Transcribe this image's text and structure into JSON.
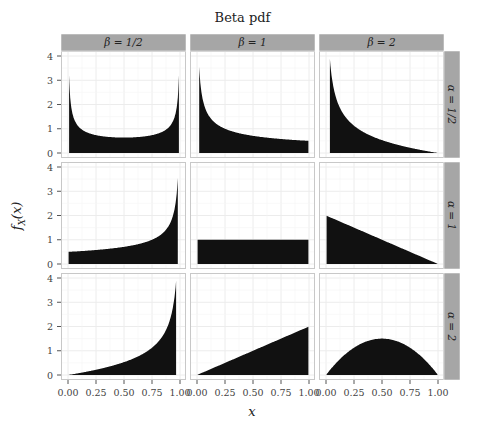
{
  "chart_data": {
    "type": "area",
    "title": "Beta pdf",
    "xlabel": "x",
    "ylabel": "f_X(x)",
    "xlim": [
      0,
      1
    ],
    "ylim": [
      0,
      4
    ],
    "x_ticks": [
      "0.00",
      "0.25",
      "0.50",
      "0.75",
      "1.00"
    ],
    "y_ticks": [
      "0",
      "1",
      "2",
      "3",
      "4"
    ],
    "grid": true,
    "facet_columns": [
      "β = 1/2",
      "β = 1",
      "β = 2"
    ],
    "facet_rows": [
      "α = 1/2",
      "α = 1",
      "α = 2"
    ],
    "fill_color": "#111111",
    "strip_color": "#a6a6a6",
    "panels": [
      {
        "row": "α = 1/2",
        "col": "β = 1/2",
        "alpha": 0.5,
        "beta": 0.5,
        "shape": "U-shaped, min 0.64 at x=0.5, ~3.5 at edges (clipped)"
      },
      {
        "row": "α = 1/2",
        "col": "β = 1",
        "alpha": 0.5,
        "beta": 1,
        "shape": "decreasing from ~3.9 to 0.5"
      },
      {
        "row": "α = 1/2",
        "col": "β = 2",
        "alpha": 0.5,
        "beta": 2,
        "shape": "decreasing from ~4 to 0"
      },
      {
        "row": "α = 1",
        "col": "β = 1/2",
        "alpha": 1,
        "beta": 0.5,
        "shape": "increasing from 0.5 to ~3.9"
      },
      {
        "row": "α = 1",
        "col": "β = 1",
        "alpha": 1,
        "beta": 1,
        "shape": "uniform at 1"
      },
      {
        "row": "α = 1",
        "col": "β = 2",
        "alpha": 1,
        "beta": 2,
        "shape": "linear from 2 to 0"
      },
      {
        "row": "α = 2",
        "col": "β = 1/2",
        "alpha": 2,
        "beta": 0.5,
        "shape": "increasing from 0 to ~4"
      },
      {
        "row": "α = 2",
        "col": "β = 1",
        "alpha": 2,
        "beta": 1,
        "shape": "linear from 0 to 2"
      },
      {
        "row": "α = 2",
        "col": "β = 2",
        "alpha": 2,
        "beta": 2,
        "shape": "parabola 6x(1-x), peak 1.5 at x=0.5"
      }
    ]
  },
  "labels": {
    "title": "Beta pdf",
    "xlabel": "x",
    "ylabel": "f_X(x)"
  }
}
